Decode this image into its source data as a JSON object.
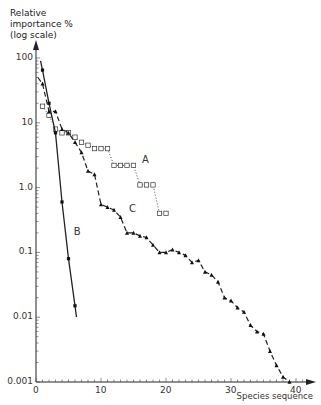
{
  "chart_data": {
    "type": "scatter",
    "title": "",
    "ylabel": "Relative importance % (log scale)",
    "ylabel_lines": [
      "Relative",
      "importance %",
      "(log scale)"
    ],
    "xlabel": "Species sequence",
    "yscale": "log",
    "ylim": [
      0.001,
      100
    ],
    "xlim": [
      0,
      42
    ],
    "y_ticks": [
      {
        "value": 100,
        "label": "100"
      },
      {
        "value": 10,
        "label": "10"
      },
      {
        "value": 1,
        "label": "1.0"
      },
      {
        "value": 0.1,
        "label": "0.1"
      },
      {
        "value": 0.01,
        "label": "0.01"
      },
      {
        "value": 0.001,
        "label": "0.001"
      }
    ],
    "x_ticks": [
      {
        "value": 0,
        "label": "0"
      },
      {
        "value": 10,
        "label": "10"
      },
      {
        "value": 20,
        "label": "20"
      },
      {
        "value": 30,
        "label": "30"
      },
      {
        "value": 40,
        "label": "40"
      }
    ],
    "grid": false,
    "legend": "none (curves labelled inline A, B, C)",
    "series": [
      {
        "name": "A",
        "marker": "open-square",
        "line": "dotted",
        "x": [
          1,
          2,
          3,
          4,
          5,
          6,
          7,
          8,
          9,
          10,
          11,
          12,
          13,
          14,
          15,
          16,
          17,
          18,
          19,
          20
        ],
        "values": [
          18,
          13,
          8,
          7,
          7,
          6,
          5,
          4.5,
          4,
          4,
          4,
          2.2,
          2.2,
          2.2,
          2.2,
          1.1,
          1.1,
          1.1,
          0.4,
          0.4
        ]
      },
      {
        "name": "B",
        "marker": "filled-circle",
        "line": "solid",
        "x": [
          1,
          2,
          3,
          4,
          5,
          6
        ],
        "values": [
          65,
          20,
          7,
          0.6,
          0.08,
          0.015
        ]
      },
      {
        "name": "C",
        "marker": "filled-triangle",
        "line": "dashed",
        "x": [
          1,
          2,
          3,
          4,
          5,
          6,
          7,
          8,
          9,
          10,
          11,
          12,
          13,
          14,
          15,
          16,
          17,
          18,
          19,
          20,
          21,
          22,
          23,
          24,
          25,
          26,
          27,
          28,
          29,
          30,
          31,
          32,
          33,
          34,
          35,
          36,
          37,
          38,
          39
        ],
        "values": [
          40,
          15,
          15,
          8,
          7,
          5,
          3.5,
          1.8,
          1.6,
          0.55,
          0.5,
          0.45,
          0.35,
          0.2,
          0.2,
          0.18,
          0.17,
          0.13,
          0.1,
          0.1,
          0.11,
          0.1,
          0.09,
          0.07,
          0.075,
          0.05,
          0.045,
          0.035,
          0.02,
          0.018,
          0.014,
          0.012,
          0.0075,
          0.006,
          0.0055,
          0.003,
          0.0018,
          0.0012,
          0.001
        ]
      }
    ],
    "annotations": [
      {
        "text": "A",
        "x": 16,
        "y": 2.6
      },
      {
        "text": "B",
        "x": 5.5,
        "y": 0.2
      },
      {
        "text": "C",
        "x": 14,
        "y": 0.45
      }
    ]
  }
}
